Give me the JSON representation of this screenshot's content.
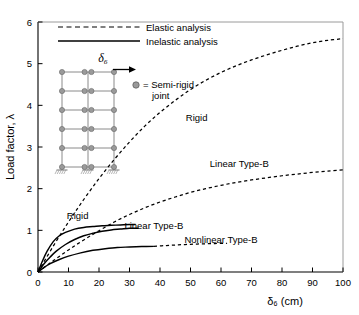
{
  "chart_data": {
    "type": "line",
    "title": "",
    "xlabel": "δ₆ (cm)",
    "ylabel": "Load factor, λ",
    "xlim": [
      0,
      100
    ],
    "ylim": [
      0,
      6
    ],
    "xticks": [
      0,
      10,
      20,
      30,
      40,
      50,
      60,
      70,
      80,
      90,
      100
    ],
    "yticks": [
      0,
      1,
      2,
      3,
      4,
      5,
      6
    ],
    "grid": false,
    "legend_position": "top-left",
    "legend": [
      {
        "label": "Elastic analysis",
        "style": "dashed"
      },
      {
        "label": "Inelastic analysis",
        "style": "solid"
      }
    ],
    "series": [
      {
        "name": "Rigid (elastic)",
        "style": "dashed",
        "label": "Rigid",
        "x": [
          0,
          5,
          10,
          15,
          20,
          25,
          30,
          35,
          40,
          45,
          50,
          55,
          60,
          65,
          70,
          75,
          80,
          85,
          90,
          95,
          100
        ],
        "y": [
          0,
          0.62,
          1.2,
          1.74,
          2.24,
          2.7,
          3.12,
          3.5,
          3.83,
          4.12,
          4.38,
          4.6,
          4.79,
          4.95,
          5.09,
          5.21,
          5.32,
          5.42,
          5.5,
          5.56,
          5.6
        ]
      },
      {
        "name": "Linear Type-B (elastic)",
        "style": "dashed",
        "label": "Linear Type-B",
        "x": [
          0,
          5,
          10,
          15,
          20,
          25,
          30,
          35,
          40,
          45,
          50,
          55,
          60,
          65,
          70,
          75,
          80,
          85,
          90,
          95,
          100
        ],
        "y": [
          0,
          0.27,
          0.53,
          0.77,
          0.99,
          1.2,
          1.38,
          1.54,
          1.68,
          1.8,
          1.91,
          2.0,
          2.08,
          2.15,
          2.21,
          2.26,
          2.31,
          2.35,
          2.39,
          2.42,
          2.45
        ]
      },
      {
        "name": "Nonlinear Type-B (elastic)",
        "style": "dashed",
        "label": "Nonlinear Type-B",
        "x": [
          38,
          42,
          46,
          50,
          54,
          58,
          62
        ],
        "y": [
          0.615,
          0.635,
          0.652,
          0.665,
          0.675,
          0.683,
          0.69
        ]
      },
      {
        "name": "Rigid (inelastic)",
        "style": "solid",
        "label": "Rigid",
        "x": [
          0,
          1.5,
          3,
          5,
          7,
          9,
          12,
          15,
          18,
          21,
          24,
          27,
          30,
          32
        ],
        "y": [
          0,
          0.27,
          0.5,
          0.73,
          0.87,
          0.95,
          1.03,
          1.07,
          1.09,
          1.11,
          1.12,
          1.13,
          1.14,
          1.14
        ]
      },
      {
        "name": "Linear Type-B (inelastic)",
        "style": "solid",
        "label": "Linear Type-B",
        "x": [
          0,
          2,
          4,
          6,
          9,
          12,
          15,
          18,
          21,
          24,
          27,
          30,
          32,
          33
        ],
        "y": [
          0,
          0.2,
          0.36,
          0.5,
          0.66,
          0.78,
          0.87,
          0.93,
          0.98,
          1.01,
          1.03,
          1.05,
          1.05,
          1.05
        ]
      },
      {
        "name": "Nonlinear Type-B (inelastic)",
        "style": "solid",
        "label": "",
        "x": [
          0,
          2,
          4,
          7,
          10,
          14,
          18,
          22,
          26,
          30,
          34,
          38
        ],
        "y": [
          0,
          0.11,
          0.2,
          0.3,
          0.38,
          0.46,
          0.52,
          0.56,
          0.59,
          0.6,
          0.61,
          0.615
        ]
      }
    ],
    "annotations": [
      {
        "text": "Rigid",
        "x": 52,
        "y": 3.62
      },
      {
        "text": "Linear Type-B",
        "x": 66,
        "y": 2.52
      },
      {
        "text": "Rigid",
        "x": 13,
        "y": 1.28
      },
      {
        "text": "Linear Type-B",
        "x": 38,
        "y": 1.03
      },
      {
        "text": "Nonlinear Type-B",
        "x": 60,
        "y": 0.7
      }
    ],
    "inset": {
      "joint_legend_text_line1": "= Semi-rigid",
      "joint_legend_text_line2": "joint",
      "displacement_label": "δ₆",
      "stories": 6,
      "bays": 2,
      "supports": 3
    }
  },
  "colors": {
    "ink": "#000000",
    "frame_line": "#8a8a8a",
    "joint_fill": "#9a9a9a",
    "background": "#ffffff"
  }
}
